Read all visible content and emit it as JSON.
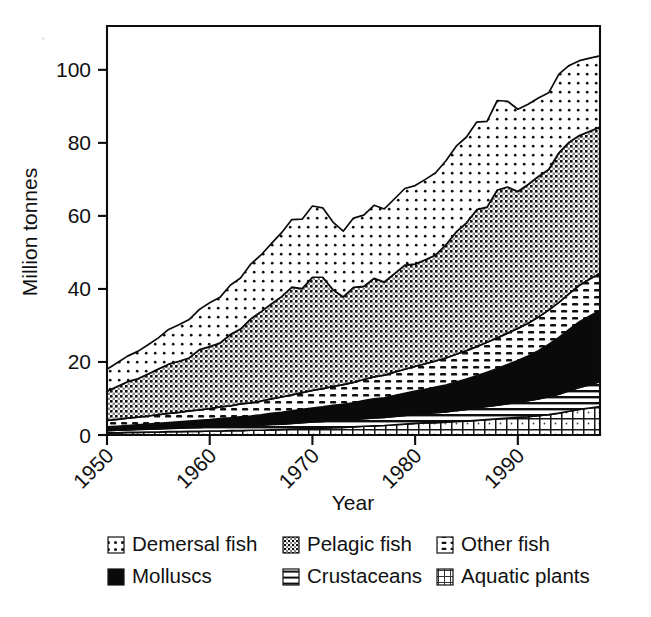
{
  "figure": {
    "background_color": "#ffffff",
    "ink_color": "#0d0d0d"
  },
  "axes": {
    "x_title": "Year",
    "y_title": "Million tonnes",
    "x_ticks": [
      "1950",
      "1960",
      "1970",
      "1980",
      "1990"
    ],
    "y_ticks": [
      "0",
      "20",
      "40",
      "60",
      "80",
      "100"
    ]
  },
  "legend": {
    "entries": [
      {
        "label": "Demersal fish",
        "pattern": "sparse-dots",
        "swatch_name": "legend-swatch-demersal-fish"
      },
      {
        "label": "Pelagic fish",
        "pattern": "dense-checker-dots",
        "swatch_name": "legend-swatch-pelagic-fish"
      },
      {
        "label": "Other fish",
        "pattern": "horizontal-dashes",
        "swatch_name": "legend-swatch-other-fish"
      },
      {
        "label": "Molluscs",
        "pattern": "solid-black",
        "swatch_name": "legend-swatch-molluscs"
      },
      {
        "label": "Crustaceans",
        "pattern": "horizontal-lines",
        "swatch_name": "legend-swatch-crustaceans"
      },
      {
        "label": "Aquatic plants",
        "pattern": "fine-grid",
        "swatch_name": "legend-swatch-aquatic-plants"
      }
    ]
  },
  "chart_data": {
    "type": "area",
    "title": "",
    "subtitle": "",
    "xlabel": "Year",
    "ylabel": "Million tonnes",
    "xlim": [
      1950,
      1998
    ],
    "ylim": [
      0,
      112
    ],
    "grid": false,
    "stacked": true,
    "legend_position": "below",
    "annotations": [],
    "x": [
      1950,
      1951,
      1952,
      1953,
      1954,
      1955,
      1956,
      1957,
      1958,
      1959,
      1960,
      1961,
      1962,
      1963,
      1964,
      1965,
      1966,
      1967,
      1968,
      1969,
      1970,
      1971,
      1972,
      1973,
      1974,
      1975,
      1976,
      1977,
      1978,
      1979,
      1980,
      1981,
      1982,
      1983,
      1984,
      1985,
      1986,
      1987,
      1988,
      1989,
      1990,
      1991,
      1992,
      1993,
      1994,
      1995,
      1996,
      1997,
      1998
    ],
    "stack_order_bottom_to_top": [
      "Aquatic plants",
      "Crustaceans",
      "Molluscs",
      "Other fish",
      "Pelagic fish",
      "Demersal fish"
    ],
    "series": [
      {
        "name": "Aquatic plants",
        "pattern": "fine-grid",
        "values": [
          0.6,
          0.6,
          0.7,
          0.7,
          0.8,
          0.8,
          0.9,
          0.9,
          1.0,
          1.0,
          1.1,
          1.1,
          1.2,
          1.2,
          1.3,
          1.3,
          1.4,
          1.5,
          1.6,
          1.7,
          1.8,
          1.9,
          2.0,
          2.1,
          2.2,
          2.4,
          2.5,
          2.6,
          2.8,
          3.0,
          3.2,
          3.3,
          3.4,
          3.5,
          3.7,
          3.8,
          4.0,
          4.2,
          4.4,
          4.6,
          4.8,
          5.0,
          5.3,
          5.6,
          6.0,
          6.5,
          7.0,
          7.4,
          7.8
        ]
      },
      {
        "name": "Crustaceans",
        "pattern": "horizontal-lines",
        "values": [
          0.6,
          0.7,
          0.7,
          0.8,
          0.8,
          0.9,
          0.9,
          1.0,
          1.0,
          1.1,
          1.1,
          1.2,
          1.2,
          1.3,
          1.3,
          1.4,
          1.5,
          1.5,
          1.6,
          1.7,
          1.8,
          1.8,
          1.9,
          1.9,
          2.0,
          2.1,
          2.2,
          2.2,
          2.3,
          2.4,
          2.5,
          2.6,
          2.7,
          2.8,
          3.0,
          3.2,
          3.4,
          3.6,
          3.8,
          4.0,
          4.2,
          4.4,
          4.6,
          4.9,
          5.2,
          5.6,
          6.0,
          6.4,
          6.8
        ]
      },
      {
        "name": "Molluscs",
        "pattern": "solid-black",
        "values": [
          1.0,
          1.1,
          1.2,
          1.3,
          1.4,
          1.5,
          1.6,
          1.7,
          1.8,
          1.9,
          2.0,
          2.2,
          2.3,
          2.5,
          2.6,
          2.8,
          3.0,
          3.2,
          3.4,
          3.6,
          3.8,
          4.0,
          4.2,
          4.4,
          4.6,
          4.9,
          5.2,
          5.4,
          5.7,
          6.0,
          6.3,
          6.6,
          7.0,
          7.4,
          7.8,
          8.3,
          8.8,
          9.4,
          10.0,
          10.7,
          11.4,
          12.2,
          13.2,
          14.3,
          15.5,
          16.8,
          18.0,
          18.8,
          19.5
        ]
      },
      {
        "name": "Other fish",
        "pattern": "horizontal-dashes",
        "values": [
          1.8,
          1.9,
          2.0,
          2.1,
          2.2,
          2.4,
          2.5,
          2.6,
          2.8,
          2.9,
          3.0,
          3.2,
          3.3,
          3.5,
          3.6,
          3.8,
          4.0,
          4.2,
          4.4,
          4.6,
          4.8,
          5.0,
          5.2,
          5.4,
          5.6,
          5.8,
          6.0,
          6.2,
          6.4,
          6.6,
          6.8,
          7.0,
          7.2,
          7.4,
          7.6,
          7.8,
          8.0,
          8.2,
          8.4,
          8.6,
          8.8,
          9.0,
          9.2,
          9.4,
          9.6,
          9.8,
          10.0,
          10.1,
          10.2
        ]
      },
      {
        "name": "Pelagic fish",
        "pattern": "dense-checker-dots",
        "values": [
          8.0,
          9.0,
          10.0,
          10.5,
          11.5,
          12.5,
          13.5,
          14.0,
          14.5,
          16.5,
          17.0,
          17.5,
          19.5,
          20.5,
          23.0,
          24.5,
          26.0,
          27.5,
          29.5,
          28.5,
          31.0,
          30.5,
          26.5,
          24.0,
          26.0,
          25.5,
          27.0,
          25.5,
          27.0,
          28.5,
          28.0,
          28.5,
          29.0,
          31.0,
          33.5,
          35.0,
          37.5,
          37.0,
          40.5,
          40.0,
          37.5,
          38.0,
          38.5,
          38.5,
          41.0,
          41.5,
          41.0,
          40.5,
          40.0
        ]
      },
      {
        "name": "Demersal fish",
        "pattern": "sparse-dots",
        "values": [
          6.0,
          6.5,
          7.0,
          7.5,
          8.0,
          8.5,
          9.5,
          10.0,
          10.5,
          11.0,
          12.0,
          12.5,
          13.5,
          14.0,
          15.0,
          15.5,
          16.5,
          17.5,
          18.5,
          19.0,
          19.5,
          19.0,
          18.5,
          18.0,
          19.0,
          19.5,
          20.0,
          20.0,
          20.5,
          21.0,
          21.5,
          22.0,
          22.5,
          23.0,
          23.5,
          23.5,
          24.0,
          23.5,
          24.5,
          23.5,
          22.5,
          22.0,
          21.5,
          21.0,
          21.5,
          21.0,
          20.5,
          20.0,
          19.5
        ]
      }
    ],
    "totals_note": "Stacked totals rise from about 18 million tonnes in 1950 to about 104 million tonnes at the late-1990s peak."
  }
}
